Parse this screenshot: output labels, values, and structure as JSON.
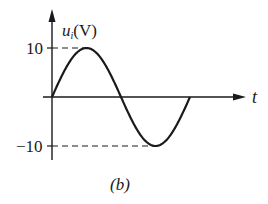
{
  "figure": {
    "caption": "(b)",
    "y_axis": {
      "symbol": "u",
      "subscript": "i",
      "unit": "(V)"
    },
    "x_axis": {
      "label": "t"
    },
    "ticks": {
      "max_label": "10",
      "min_label": "−10"
    },
    "colors": {
      "line": "#1a1a1a",
      "background": "#ffffff"
    }
  },
  "chart_data": {
    "type": "line",
    "title": "",
    "caption": "(b)",
    "xlabel": "t",
    "ylabel": "u_i(V)",
    "ylim": [
      -10,
      10
    ],
    "y_ticks": [
      10,
      -10
    ],
    "grid": false,
    "legend": null,
    "series": [
      {
        "name": "u_i",
        "function": "10*sin(t)",
        "x": [
          "0",
          "T/4",
          "T/2",
          "3T/4",
          "T"
        ],
        "values": [
          0,
          10,
          0,
          -10,
          0
        ]
      }
    ],
    "annotations": [
      "dashed reference line at u=10 to peak",
      "dashed reference line at u=-10 to trough"
    ]
  }
}
